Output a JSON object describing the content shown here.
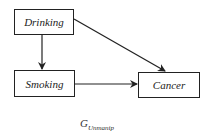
{
  "diagram": {
    "type": "causal-graph",
    "nodes": [
      {
        "id": "drinking",
        "label": "Drinking"
      },
      {
        "id": "smoking",
        "label": "Smoking"
      },
      {
        "id": "cancer",
        "label": "Cancer"
      }
    ],
    "edges": [
      {
        "from": "drinking",
        "to": "smoking"
      },
      {
        "from": "drinking",
        "to": "cancer"
      },
      {
        "from": "smoking",
        "to": "cancer"
      }
    ],
    "caption": {
      "main": "G",
      "subscript": "Unmanip"
    }
  }
}
